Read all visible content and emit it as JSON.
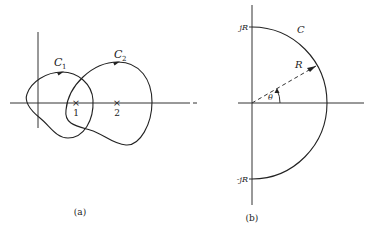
{
  "figure": {
    "panels": [
      {
        "id": "a",
        "caption": "(a)",
        "contours": [
          {
            "label_main": "C",
            "label_sub": "1",
            "direction": "counterclockwise"
          },
          {
            "label_main": "C",
            "label_sub": "2",
            "direction": "counterclockwise"
          }
        ],
        "poles": [
          {
            "marker": "×",
            "label": "1"
          },
          {
            "marker": "×",
            "label": "2"
          }
        ]
      },
      {
        "id": "b",
        "caption": "(b)",
        "contour_label": "C",
        "radius_label": "R",
        "angle_label": "θ",
        "upper_intercept_label": "jR",
        "lower_intercept_label": "-jR"
      }
    ]
  }
}
